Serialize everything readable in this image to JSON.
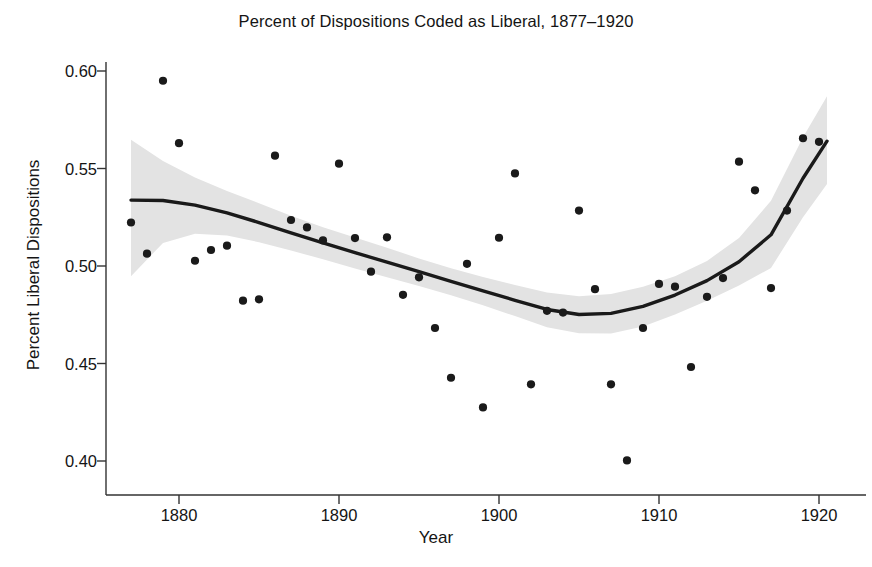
{
  "chart_data": {
    "type": "scatter",
    "title": "Percent of Dispositions Coded as Liberal, 1877–1920",
    "xlabel": "Year",
    "ylabel": "Percent Liberal Dispositions",
    "xlim": [
      1876.2,
      1920.8
    ],
    "ylim": [
      0.392,
      0.605
    ],
    "grid": false,
    "legend": null,
    "xticks": [
      1880,
      1890,
      1900,
      1910,
      1920
    ],
    "xtick_labels": [
      "1880",
      "1890",
      "1900",
      "1910",
      "1920"
    ],
    "yticks": [
      0.4,
      0.45,
      0.5,
      0.55,
      0.6
    ],
    "ytick_labels": [
      "0.40",
      "0.45",
      "0.50",
      "0.55",
      "0.60"
    ],
    "point_color": "#1a1a1a",
    "line_color": "#1a1a1a",
    "band_color": "#e3e3e3",
    "series": [
      {
        "name": "Percent Liberal Dispositions",
        "x": [
          1877.0,
          1878.0,
          1879.0,
          1880.0,
          1881.0,
          1882.0,
          1883.0,
          1884.0,
          1885.0,
          1886.0,
          1887.0,
          1888.0,
          1889.0,
          1890.0,
          1891.0,
          1892.0,
          1893.0,
          1894.0,
          1895.0,
          1896.0,
          1897.0,
          1898.0,
          1899.0,
          1900.0,
          1901.0,
          1902.0,
          1903.0,
          1904.0,
          1905.0,
          1906.0,
          1907.0,
          1908.0,
          1909.0,
          1910.0,
          1911.0,
          1912.0,
          1913.0,
          1914.0,
          1915.0,
          1916.0,
          1917.0,
          1918.0,
          1919.0,
          1920.0
        ],
        "y": [
          0.5223,
          0.5063,
          0.595,
          0.563,
          0.5027,
          0.5082,
          0.5104,
          0.4822,
          0.4829,
          0.5566,
          0.5236,
          0.5198,
          0.5131,
          0.5525,
          0.5143,
          0.4971,
          0.5147,
          0.4852,
          0.4942,
          0.4682,
          0.4427,
          0.5011,
          0.4275,
          0.5145,
          0.5475,
          0.4393,
          0.477,
          0.4761,
          0.5284,
          0.4881,
          0.4393,
          0.4003,
          0.4682,
          0.4908,
          0.4894,
          0.4482,
          0.4842,
          0.4938,
          0.5535,
          0.5388,
          0.4887,
          0.5284,
          0.5655,
          0.5637
        ]
      }
    ],
    "fit": {
      "name": "loess-smooth",
      "x": [
        1877.0,
        1879.0,
        1881.0,
        1883.0,
        1885.0,
        1887.0,
        1889.0,
        1891.0,
        1893.0,
        1895.0,
        1897.0,
        1899.0,
        1901.0,
        1903.0,
        1905.0,
        1907.0,
        1909.0,
        1911.0,
        1913.0,
        1915.0,
        1917.0,
        1919.0,
        1920.5
      ],
      "y": [
        0.5338,
        0.5336,
        0.5312,
        0.5272,
        0.5223,
        0.517,
        0.5118,
        0.5068,
        0.502,
        0.4971,
        0.4921,
        0.4873,
        0.4824,
        0.4777,
        0.4751,
        0.4757,
        0.4793,
        0.4851,
        0.4925,
        0.5022,
        0.516,
        0.545,
        0.564
      ],
      "ci_upper": [
        0.5648,
        0.5539,
        0.5454,
        0.5385,
        0.5322,
        0.5258,
        0.5199,
        0.5146,
        0.5093,
        0.5039,
        0.4988,
        0.4943,
        0.4902,
        0.4864,
        0.4845,
        0.4856,
        0.4893,
        0.4948,
        0.5026,
        0.5144,
        0.5334,
        0.566,
        0.587
      ],
      "ci_lower": [
        0.4948,
        0.5118,
        0.5165,
        0.5157,
        0.5122,
        0.508,
        0.5034,
        0.4987,
        0.4942,
        0.4898,
        0.485,
        0.4799,
        0.4743,
        0.4686,
        0.4655,
        0.4654,
        0.469,
        0.4751,
        0.4822,
        0.49,
        0.499,
        0.525,
        0.542
      ]
    }
  }
}
